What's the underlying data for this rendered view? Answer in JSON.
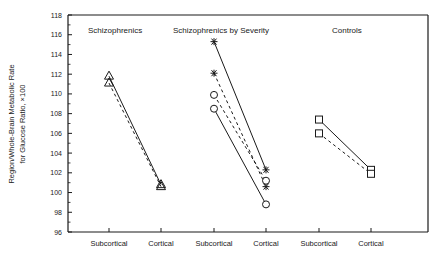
{
  "chart_data": {
    "type": "line",
    "title": "",
    "ylabel_line1": "Region/Whole-Brain Metabolic Rate",
    "ylabel_line2": "for Glucose Ratio, ×100",
    "xlabel": "",
    "ylim": [
      96,
      118
    ],
    "yticks": [
      96,
      98,
      100,
      102,
      104,
      106,
      108,
      110,
      112,
      114,
      116,
      118
    ],
    "grid": false,
    "legend": "none",
    "categories": [
      "Subcortical",
      "Cortical",
      "Subcortical",
      "Cortical",
      "Subcortical",
      "Cortical"
    ],
    "panels": [
      {
        "title": "Schizophrenics",
        "categories": [
          "Subcortical",
          "Cortical"
        ],
        "series": [
          {
            "name": "Schizophrenics (series A)",
            "marker": "triangle",
            "line": "solid",
            "values": [
              111.8,
              100.8
            ]
          },
          {
            "name": "Schizophrenics (series B)",
            "marker": "triangle",
            "line": "dashed",
            "values": [
              111.1,
              100.6
            ]
          }
        ]
      },
      {
        "title": "Schizophrenics by Severity",
        "categories": [
          "Subcortical",
          "Cortical"
        ],
        "series": [
          {
            "name": "Severity group 1",
            "marker": "star",
            "line": "solid",
            "values": [
              115.3,
              102.3
            ]
          },
          {
            "name": "Severity group 2",
            "marker": "star",
            "line": "dashed",
            "values": [
              112.1,
              100.6
            ]
          },
          {
            "name": "Severity group 3",
            "marker": "circle",
            "line": "dashed",
            "values": [
              109.9,
              101.2
            ]
          },
          {
            "name": "Severity group 4",
            "marker": "circle",
            "line": "solid",
            "values": [
              108.5,
              98.8
            ]
          }
        ]
      },
      {
        "title": "Controls",
        "categories": [
          "Subcortical",
          "Cortical"
        ],
        "series": [
          {
            "name": "Controls (series A)",
            "marker": "square",
            "line": "solid",
            "values": [
              107.4,
              102.3
            ]
          },
          {
            "name": "Controls (series B)",
            "marker": "square",
            "line": "dashed",
            "values": [
              106.0,
              101.9
            ]
          }
        ]
      }
    ]
  },
  "layout": {
    "plot": {
      "left": 68,
      "right": 428,
      "top": 15,
      "bottom": 232
    },
    "x_positions": [
      109,
      161,
      214,
      266,
      319,
      371
    ],
    "panel_title_x": [
      88,
      173,
      332
    ],
    "panel_title_y": 30
  },
  "colors": {
    "ink": "#1a1a1a",
    "background": "#ffffff"
  }
}
